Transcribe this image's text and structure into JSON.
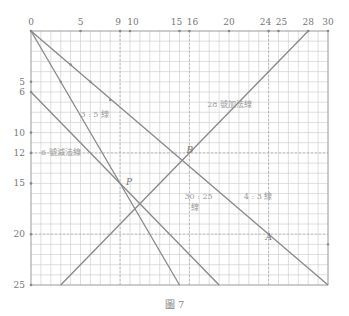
{
  "figure": {
    "caption": "圖 7",
    "x_ticks": [
      "0",
      "5",
      "9",
      "10",
      "15",
      "16",
      "20",
      "24",
      "25",
      "28",
      "30"
    ],
    "y_ticks": [
      "5",
      "6",
      "10",
      "12",
      "15",
      "20",
      "25"
    ],
    "labels": {
      "line_28": "28 號加法線",
      "line_35": "3 : 5 線",
      "line_6": "6 號減法線",
      "ratio_3025": "30 : 25",
      "ratio_3025_b": "線",
      "ratio_43": "4 : 3 線"
    },
    "points": {
      "P": "P",
      "B": "B",
      "A": "A"
    },
    "colors": {
      "grid": "#c8c8c8",
      "line": "#888888",
      "text": "#777777"
    }
  },
  "chart_data": {
    "type": "line",
    "title": "圖 7",
    "xlim": [
      0,
      30
    ],
    "ylim": [
      25,
      0
    ],
    "grid": true,
    "x_ticks": [
      0,
      5,
      9,
      10,
      15,
      16,
      20,
      24,
      25,
      28,
      30
    ],
    "y_ticks": [
      5,
      6,
      10,
      12,
      15,
      20,
      25
    ],
    "series": [
      {
        "name": "30:25 線",
        "points": [
          [
            0,
            0
          ],
          [
            30,
            25
          ]
        ]
      },
      {
        "name": "3:5 線",
        "points": [
          [
            0,
            0
          ],
          [
            15,
            25
          ]
        ]
      },
      {
        "name": "6 號減法線",
        "points": [
          [
            0,
            6
          ],
          [
            19,
            25
          ]
        ]
      },
      {
        "name": "28 號加法線",
        "points": [
          [
            3,
            25
          ],
          [
            28,
            0
          ]
        ]
      }
    ],
    "annotations": [
      {
        "label": "P",
        "x": 9,
        "y": 15
      },
      {
        "label": "B",
        "x": 16,
        "y": 12
      },
      {
        "label": "A",
        "x": 24,
        "y": 20
      }
    ],
    "reference_lines": [
      {
        "axis": "x",
        "value": 9
      },
      {
        "axis": "x",
        "value": 16
      },
      {
        "axis": "x",
        "value": 24
      },
      {
        "axis": "y",
        "value": 12
      },
      {
        "axis": "y",
        "value": 20
      }
    ]
  }
}
